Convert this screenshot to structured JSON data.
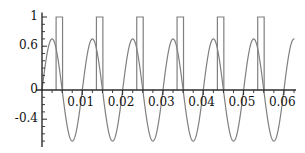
{
  "chart_data": {
    "type": "line",
    "title": "",
    "xlabel": "",
    "ylabel": "",
    "xlim": [
      0,
      0.0625
    ],
    "ylim": [
      -0.78,
      1.06
    ],
    "grid": false,
    "legend": "none",
    "x_ticks": [
      {
        "value": 0.01,
        "label": "0.01"
      },
      {
        "value": 0.02,
        "label": "0.02"
      },
      {
        "value": 0.03,
        "label": "0.03"
      },
      {
        "value": 0.04,
        "label": "0.04"
      },
      {
        "value": 0.05,
        "label": "0.05"
      },
      {
        "value": 0.06,
        "label": "0.06"
      }
    ],
    "y_ticks": [
      {
        "value": 1,
        "label": "1"
      },
      {
        "value": 0.6,
        "label": "0.6"
      },
      {
        "value": 0,
        "label": "0"
      },
      {
        "value": -0.4,
        "label": "-0.4"
      }
    ],
    "y_minor_ticks": [
      0.9,
      0.8,
      0.7,
      0.5,
      0.4,
      0.3,
      0.2,
      0.1,
      -0.1,
      -0.2,
      -0.3,
      -0.5,
      -0.6,
      -0.7
    ],
    "x_minor_ticks": [
      0.0025,
      0.005,
      0.0075,
      0.0125,
      0.015,
      0.0175,
      0.0225,
      0.025,
      0.0275,
      0.0325,
      0.035,
      0.0375,
      0.0425,
      0.045,
      0.0475,
      0.0525,
      0.055,
      0.0575,
      0.0625
    ],
    "series": [
      {
        "name": "sine-wave",
        "type": "sine",
        "amplitude": 0.7,
        "frequency_hz": 100,
        "periods": 6,
        "phase": 0,
        "color": "#808080",
        "line_width": 1.2
      },
      {
        "name": "pulse-train",
        "type": "rectangular-pulse",
        "amplitude": 1,
        "pulse_count": 6,
        "pulse_width": 0.0016,
        "period": 0.01,
        "pulse_centers": [
          0.0043,
          0.0143,
          0.0243,
          0.0343,
          0.0443,
          0.0543
        ],
        "color": "#808080",
        "line_width": 1.2
      }
    ],
    "axis_color": "#2b2b2b",
    "axis_line_width": 1.4
  }
}
